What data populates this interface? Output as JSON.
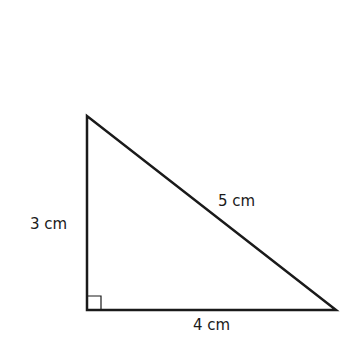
{
  "diagram": {
    "type": "right-triangle",
    "stroke_color": "#1a1a1a",
    "background_color": "#ffffff",
    "vertices": {
      "top": [
        87,
        116
      ],
      "right_angle": [
        87,
        310
      ],
      "bottom_right": [
        336,
        310
      ]
    },
    "right_angle_marker_size": 14,
    "labels": {
      "height": "3 cm",
      "hypotenuse": "5 cm",
      "base": "4 cm"
    }
  }
}
